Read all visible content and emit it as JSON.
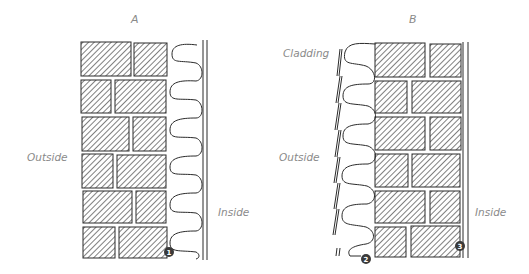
{
  "panels": [
    {
      "id": "A",
      "title": "A",
      "labels": {
        "outside": "Outside",
        "inside": "Inside"
      },
      "markers": [
        {
          "number": "1",
          "target": "brick-wall-corner"
        }
      ]
    },
    {
      "id": "B",
      "title": "B",
      "labels": {
        "cladding": "Cladding",
        "outside": "Outside",
        "inside": "Inside"
      },
      "markers": [
        {
          "number": "2",
          "target": "cladding-base"
        },
        {
          "number": "3",
          "target": "inner-wall-face"
        }
      ]
    }
  ],
  "colors": {
    "line": "#2b2b2b",
    "hatch": "#444444",
    "label": "#8a8a8a",
    "marker": "#3a3a3a"
  }
}
